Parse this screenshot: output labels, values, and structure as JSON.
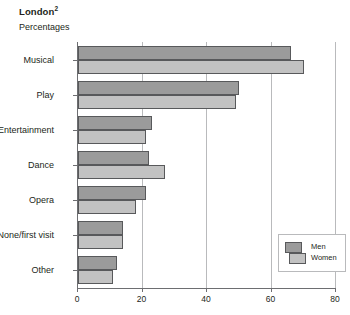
{
  "chart_data": {
    "type": "bar",
    "orientation": "horizontal",
    "title": "London",
    "title_superscript": "2",
    "subtitle": "Percentages",
    "xlabel": "",
    "ylabel": "",
    "xlim": [
      0,
      80
    ],
    "xticks": [
      0,
      20,
      40,
      60,
      80
    ],
    "xtick_labels": [
      "0",
      "20",
      "40",
      "60",
      "80"
    ],
    "grid": true,
    "grid_axis": "x",
    "legend_position": "bottom-right",
    "categories": [
      "Musical",
      "Play",
      "Entertainment",
      "Dance",
      "Opera",
      "None/first visit",
      "Other"
    ],
    "series": [
      {
        "name": "Men",
        "color": "#9b9b9b",
        "values": [
          66,
          50,
          23,
          22,
          21,
          14,
          12
        ]
      },
      {
        "name": "Women",
        "color": "#c2c2c2",
        "values": [
          70,
          49,
          21,
          27,
          18,
          14,
          11
        ]
      }
    ]
  },
  "legend": {
    "entries": [
      {
        "label": "Men"
      },
      {
        "label": "Women"
      }
    ]
  },
  "colors": {
    "men": "#9b9b9b",
    "women": "#c2c2c2",
    "axis": "#6d6e71",
    "grid": "#b9babc",
    "text": "#231f20",
    "background": "#ffffff"
  }
}
